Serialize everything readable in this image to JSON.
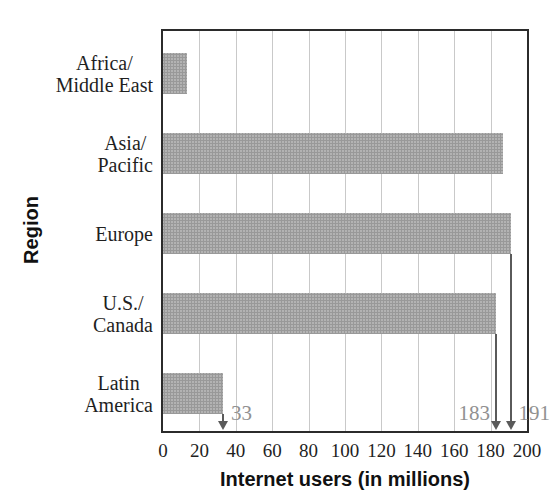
{
  "clipped_title": {
    "text": "Worldwide Internet Users"
  },
  "chart_data": {
    "type": "bar",
    "orientation": "horizontal",
    "categories": [
      "Africa/Middle East",
      "Asia/Pacific",
      "Europe",
      "U.S./Canada",
      "Latin America"
    ],
    "category_label_lines": [
      [
        "Africa/",
        "Middle East"
      ],
      [
        "Asia/",
        "Pacific"
      ],
      [
        "Europe"
      ],
      [
        "U.S./",
        "Canada"
      ],
      [
        "Latin",
        "America"
      ]
    ],
    "values": [
      13,
      187,
      191,
      183,
      33
    ],
    "xlabel": "Internet users (in millions)",
    "ylabel": "Region",
    "xlim": [
      0,
      200
    ],
    "xticks": [
      0,
      20,
      40,
      60,
      80,
      100,
      120,
      140,
      160,
      180,
      200
    ],
    "grid": true,
    "legend": false,
    "annotations": [
      {
        "category_index": 2,
        "category": "Europe",
        "value": 191,
        "label": "191",
        "label_side": "right"
      },
      {
        "category_index": 3,
        "category": "U.S./Canada",
        "value": 183,
        "label": "183",
        "label_side": "left"
      },
      {
        "category_index": 4,
        "category": "Latin America",
        "value": 33,
        "label": "33",
        "label_side": "right"
      }
    ],
    "colors": {
      "bar": "#b3b3b3",
      "bar_speckle": "#999999",
      "grid": "#c9c9c9",
      "axis_border": "#2b2b2b",
      "annotation_line": "#5a5a5a",
      "annotation_text": "#919191",
      "tick_text": "#1f1f1f",
      "axis_label_text": "#111111"
    }
  }
}
